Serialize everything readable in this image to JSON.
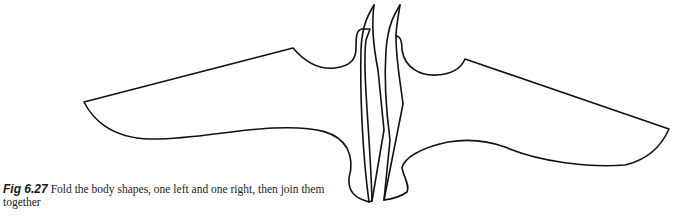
{
  "figure": {
    "label": "Fig 6.27",
    "caption": "Fold the body shapes, one left and one right, then join them together",
    "line_color": "#111111",
    "background_color": "#ffffff"
  }
}
